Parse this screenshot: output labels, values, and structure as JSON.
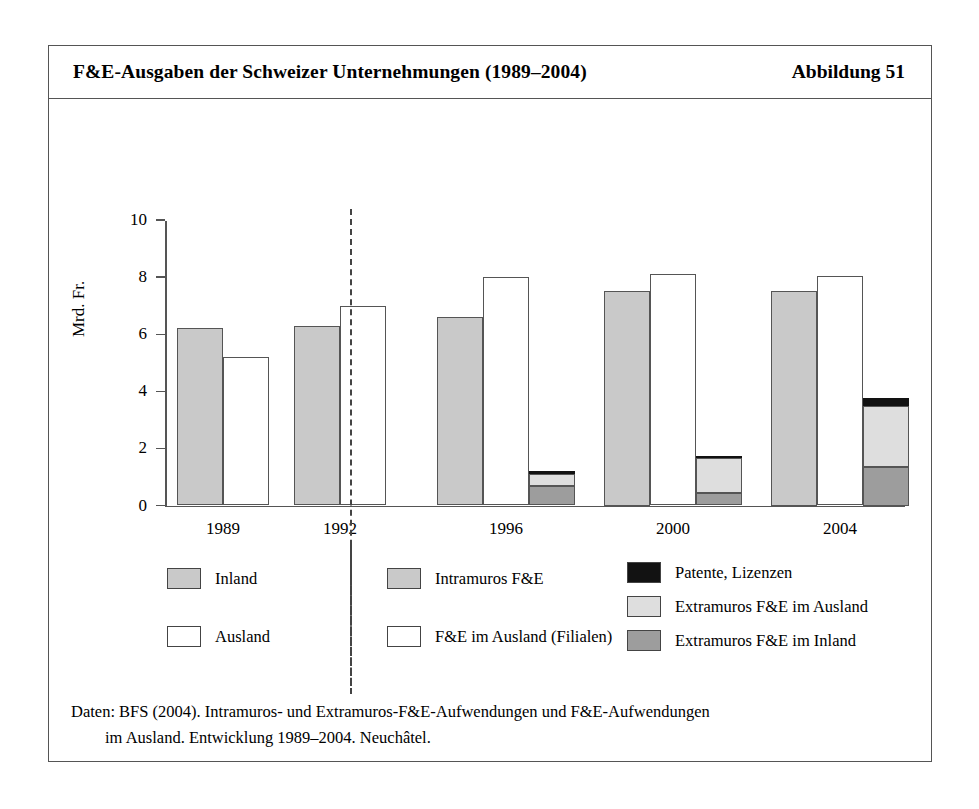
{
  "figure": {
    "title": "F&E-Ausgaben der Schweizer Unternehmungen (1989–2004)",
    "figure_number": "Abbildung 51",
    "caption_line1": "Daten: BFS (2004). Intramuros- und Extramuros-F&E-Aufwendungen und F&E-Aufwendungen",
    "caption_line2": "im Ausland. Entwicklung 1989–2004. Neuchâtel."
  },
  "chart_data": {
    "type": "bar",
    "title": "F&E-Ausgaben der Schweizer Unternehmungen (1989–2004)",
    "subtitle": "",
    "xlabel": "",
    "ylabel": "Mrd. Fr.",
    "ylim": [
      0,
      10
    ],
    "yticks": [
      0,
      2,
      4,
      6,
      8,
      10
    ],
    "ytick_labels": [
      "0",
      "2",
      "4",
      "6",
      "8",
      "10"
    ],
    "grid": false,
    "legend_position": "below",
    "categories": [
      "1989",
      "1992",
      "1996",
      "2000",
      "2004"
    ],
    "annotations": [
      "dashed vertical separator between 1992 and 1996 groups"
    ],
    "groups": [
      {
        "category": "1989",
        "bars": [
          {
            "series": "Inland",
            "value": 6.2,
            "color": "#c9c9c9",
            "stacked": false
          },
          {
            "series": "Ausland",
            "value": 5.2,
            "color": "#ffffff",
            "stacked": false
          }
        ]
      },
      {
        "category": "1992",
        "bars": [
          {
            "series": "Inland",
            "value": 6.3,
            "color": "#c9c9c9",
            "stacked": false
          },
          {
            "series": "Ausland",
            "value": 7.0,
            "color": "#ffffff",
            "stacked": false
          }
        ]
      },
      {
        "category": "1996",
        "bars": [
          {
            "series": "Intramuros F&E",
            "value": 6.6,
            "color": "#c9c9c9",
            "stacked": false
          },
          {
            "series": "F&E im Ausland (Filialen)",
            "value": 8.0,
            "color": "#ffffff",
            "stacked": false
          },
          {
            "series": "Extramuros gestapelt",
            "value": 1.2,
            "stacked": true,
            "segments": [
              {
                "name": "Extramuros F&E im Inland",
                "value": 0.7,
                "color": "#9d9d9d"
              },
              {
                "name": "Extramuros F&E im Ausland",
                "value": 0.4,
                "color": "#dedede"
              },
              {
                "name": "Patente, Lizenzen",
                "value": 0.1,
                "color": "#121212"
              }
            ]
          }
        ]
      },
      {
        "category": "2000",
        "bars": [
          {
            "series": "Intramuros F&E",
            "value": 7.5,
            "color": "#c9c9c9",
            "stacked": false
          },
          {
            "series": "F&E im Ausland (Filialen)",
            "value": 8.1,
            "color": "#ffffff",
            "stacked": false
          },
          {
            "series": "Extramuros gestapelt",
            "value": 1.75,
            "stacked": true,
            "segments": [
              {
                "name": "Extramuros F&E im Inland",
                "value": 0.45,
                "color": "#9d9d9d"
              },
              {
                "name": "Extramuros F&E im Ausland",
                "value": 1.2,
                "color": "#dedede"
              },
              {
                "name": "Patente, Lizenzen",
                "value": 0.1,
                "color": "#121212"
              }
            ]
          }
        ]
      },
      {
        "category": "2004",
        "bars": [
          {
            "series": "Intramuros F&E",
            "value": 7.5,
            "color": "#c9c9c9",
            "stacked": false
          },
          {
            "series": "F&E im Ausland (Filialen)",
            "value": 8.05,
            "color": "#ffffff",
            "stacked": false
          },
          {
            "series": "Extramuros gestapelt",
            "value": 3.75,
            "stacked": true,
            "segments": [
              {
                "name": "Extramuros F&E im Inland",
                "value": 1.35,
                "color": "#9d9d9d"
              },
              {
                "name": "Extramuros F&E im Ausland",
                "value": 2.15,
                "color": "#dedede"
              },
              {
                "name": "Patente, Lizenzen",
                "value": 0.25,
                "color": "#121212"
              }
            ]
          }
        ]
      }
    ],
    "legend": {
      "left_block": [
        {
          "label": "Inland",
          "color": "#c9c9c9"
        },
        {
          "label": "Ausland",
          "color": "#ffffff"
        }
      ],
      "middle_block": [
        {
          "label": "Intramuros F&E",
          "color": "#c9c9c9"
        },
        {
          "label": "F&E im Ausland (Filialen)",
          "color": "#ffffff"
        }
      ],
      "right_block": [
        {
          "label": "Patente, Lizenzen",
          "color": "#121212"
        },
        {
          "label": "Extramuros F&E im Ausland",
          "color": "#dedede"
        },
        {
          "label": "Extramuros F&E im Inland",
          "color": "#9d9d9d"
        }
      ]
    }
  }
}
